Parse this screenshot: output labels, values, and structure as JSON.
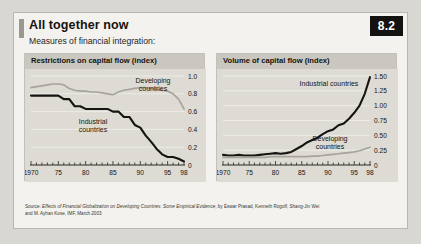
{
  "figure": {
    "number": "8.2",
    "title": "All together now",
    "subtitle": "Measures of financial integration:",
    "source_line_1_prefix": "Source: ",
    "source_line_1_italic": "Effects of Financial Globalization on Developing Countries: Some Empirical Evidence",
    "source_line_1_suffix": ", by Eswar Prasad, Kenneth Rogoff, Shang-Jin Wei",
    "source_line_2": "and M. Ayhan Kose, IMF, March 2003"
  },
  "colors": {
    "industrial_line": "#161412",
    "developing_line": "#a6a49c",
    "panel_bg": "#dddbd4",
    "panel_header_bg": "#c9c7bf",
    "card_bg": "#f3f2ee",
    "page_bg": "#d8d7d2",
    "badge_bg": "#141210",
    "gridline": "#edece7",
    "axis": "#2b2822"
  },
  "chart_data": [
    {
      "type": "line",
      "title": "Restrictions on capital flow (index)",
      "xlabel": "",
      "ylabel": "",
      "xlim": [
        1970,
        1998
      ],
      "ylim": [
        0,
        1.0
      ],
      "grid": true,
      "legend_position": "inline-annotation",
      "xticks": [
        1970,
        1975,
        1980,
        1985,
        1990,
        1995,
        1998
      ],
      "xticklabels": [
        "1970",
        "75",
        "80",
        "85",
        "90",
        "95",
        "98"
      ],
      "yticks": [
        0,
        0.2,
        0.4,
        0.6,
        0.8,
        1.0
      ],
      "yticklabels": [
        "0",
        "0.2",
        "0.4",
        "0.6",
        "0.8",
        "1.0"
      ],
      "series": [
        {
          "name": "Developing countries",
          "color": "#a6a49c",
          "annotation": "Developing\ncountries",
          "x": [
            1970,
            1971,
            1972,
            1973,
            1974,
            1975,
            1976,
            1977,
            1978,
            1979,
            1980,
            1981,
            1982,
            1983,
            1984,
            1985,
            1986,
            1987,
            1988,
            1989,
            1990,
            1991,
            1992,
            1993,
            1994,
            1995,
            1996,
            1997,
            1998
          ],
          "values": [
            0.87,
            0.88,
            0.89,
            0.9,
            0.91,
            0.91,
            0.9,
            0.86,
            0.84,
            0.83,
            0.83,
            0.82,
            0.82,
            0.81,
            0.8,
            0.79,
            0.82,
            0.84,
            0.85,
            0.86,
            0.87,
            0.87,
            0.86,
            0.85,
            0.84,
            0.83,
            0.8,
            0.74,
            0.63
          ]
        },
        {
          "name": "Industrial countries",
          "color": "#161412",
          "annotation": "Industrial\ncountries",
          "x": [
            1970,
            1971,
            1972,
            1973,
            1974,
            1975,
            1976,
            1977,
            1978,
            1979,
            1980,
            1981,
            1982,
            1983,
            1984,
            1985,
            1986,
            1987,
            1988,
            1989,
            1990,
            1991,
            1992,
            1993,
            1994,
            1995,
            1996,
            1997,
            1998
          ],
          "values": [
            0.78,
            0.78,
            0.78,
            0.78,
            0.78,
            0.78,
            0.74,
            0.74,
            0.66,
            0.66,
            0.63,
            0.63,
            0.63,
            0.63,
            0.63,
            0.6,
            0.6,
            0.54,
            0.54,
            0.45,
            0.42,
            0.33,
            0.26,
            0.18,
            0.12,
            0.09,
            0.09,
            0.07,
            0.04
          ]
        }
      ]
    },
    {
      "type": "line",
      "title": "Volume of capital flow (index)",
      "xlabel": "",
      "ylabel": "",
      "xlim": [
        1970,
        1998
      ],
      "ylim": [
        0,
        1.5
      ],
      "grid": true,
      "legend_position": "inline-annotation",
      "xticks": [
        1970,
        1975,
        1980,
        1985,
        1990,
        1995,
        1998
      ],
      "xticklabels": [
        "1970",
        "75",
        "80",
        "85",
        "90",
        "95",
        "98"
      ],
      "yticks": [
        0,
        0.25,
        0.5,
        0.75,
        1.0,
        1.25,
        1.5
      ],
      "yticklabels": [
        "0",
        "0.25",
        "0.50",
        "0.75",
        "1.00",
        "1.25",
        "1.50"
      ],
      "series": [
        {
          "name": "Industrial countries",
          "color": "#161412",
          "annotation": "Industrial countries",
          "x": [
            1970,
            1971,
            1972,
            1973,
            1974,
            1975,
            1976,
            1977,
            1978,
            1979,
            1980,
            1981,
            1982,
            1983,
            1984,
            1985,
            1986,
            1987,
            1988,
            1989,
            1990,
            1991,
            1992,
            1993,
            1994,
            1995,
            1996,
            1997,
            1998
          ],
          "values": [
            0.17,
            0.16,
            0.16,
            0.17,
            0.16,
            0.16,
            0.16,
            0.17,
            0.18,
            0.19,
            0.2,
            0.19,
            0.2,
            0.22,
            0.27,
            0.32,
            0.38,
            0.42,
            0.46,
            0.52,
            0.57,
            0.6,
            0.67,
            0.7,
            0.78,
            0.88,
            1.0,
            1.2,
            1.48
          ]
        },
        {
          "name": "Developing countries",
          "color": "#a6a49c",
          "annotation": "Developing\ncountries",
          "x": [
            1970,
            1971,
            1972,
            1973,
            1974,
            1975,
            1976,
            1977,
            1978,
            1979,
            1980,
            1981,
            1982,
            1983,
            1984,
            1985,
            1986,
            1987,
            1988,
            1989,
            1990,
            1991,
            1992,
            1993,
            1994,
            1995,
            1996,
            1997,
            1998
          ],
          "values": [
            0.13,
            0.13,
            0.13,
            0.13,
            0.13,
            0.13,
            0.13,
            0.13,
            0.13,
            0.14,
            0.14,
            0.14,
            0.14,
            0.14,
            0.14,
            0.14,
            0.14,
            0.15,
            0.15,
            0.16,
            0.17,
            0.18,
            0.19,
            0.2,
            0.21,
            0.22,
            0.24,
            0.27,
            0.3
          ]
        }
      ]
    }
  ]
}
